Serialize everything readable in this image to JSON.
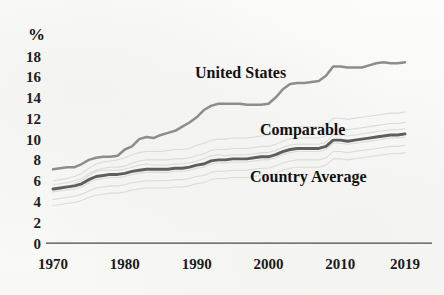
{
  "chart_data": {
    "type": "line",
    "title": "",
    "subtitle": "",
    "xlabel": "",
    "ylabel": "%",
    "ylim": [
      0,
      18
    ],
    "xlim": [
      1970,
      2019
    ],
    "grid": false,
    "legend_position": "inline-annotations",
    "y_ticks": [
      "18",
      "16",
      "14",
      "12",
      "10",
      "8",
      "6",
      "4",
      "2",
      "0"
    ],
    "y_tick_values": [
      18,
      16,
      14,
      12,
      10,
      8,
      6,
      4,
      2,
      0
    ],
    "x_ticks": [
      "1970",
      "1980",
      "1990",
      "2000",
      "2010",
      "2019"
    ],
    "x_tick_values": [
      1970,
      1980,
      1990,
      2000,
      2010,
      2019
    ],
    "annotations": [
      {
        "text": "United States",
        "x": 1990,
        "y": 16.2
      },
      {
        "text": "Comparable",
        "x": 2002,
        "y": 11.6
      },
      {
        "text": "Country Average",
        "x": 2002,
        "y": 8.0
      }
    ],
    "series": [
      {
        "name": "United States",
        "color": "#8d8d8c",
        "x": [
          1970,
          1971,
          1972,
          1973,
          1974,
          1975,
          1976,
          1977,
          1978,
          1979,
          1980,
          1981,
          1982,
          1983,
          1984,
          1985,
          1986,
          1987,
          1988,
          1989,
          1990,
          1991,
          1992,
          1993,
          1994,
          1995,
          1996,
          1997,
          1998,
          1999,
          2000,
          2001,
          2002,
          2003,
          2004,
          2005,
          2006,
          2007,
          2008,
          2009,
          2010,
          2011,
          2012,
          2013,
          2014,
          2015,
          2016,
          2017,
          2018,
          2019
        ],
        "values": [
          7.1,
          7.2,
          7.3,
          7.3,
          7.6,
          8.0,
          8.2,
          8.3,
          8.3,
          8.4,
          9.0,
          9.3,
          10.0,
          10.2,
          10.1,
          10.4,
          10.6,
          10.8,
          11.2,
          11.6,
          12.1,
          12.8,
          13.2,
          13.4,
          13.4,
          13.4,
          13.4,
          13.3,
          13.3,
          13.3,
          13.4,
          14.0,
          14.8,
          15.3,
          15.4,
          15.4,
          15.5,
          15.6,
          16.1,
          17.0,
          17.0,
          16.9,
          16.9,
          16.9,
          17.1,
          17.3,
          17.4,
          17.3,
          17.3,
          17.4
        ]
      },
      {
        "name": "Comparable Country Average",
        "color": "#5e5e5d",
        "x": [
          1970,
          1971,
          1972,
          1973,
          1974,
          1975,
          1976,
          1977,
          1978,
          1979,
          1980,
          1981,
          1982,
          1983,
          1984,
          1985,
          1986,
          1987,
          1988,
          1989,
          1990,
          1991,
          1992,
          1993,
          1994,
          1995,
          1996,
          1997,
          1998,
          1999,
          2000,
          2001,
          2002,
          2003,
          2004,
          2005,
          2006,
          2007,
          2008,
          2009,
          2010,
          2011,
          2012,
          2013,
          2014,
          2015,
          2016,
          2017,
          2018,
          2019
        ],
        "values": [
          5.2,
          5.3,
          5.4,
          5.5,
          5.7,
          6.1,
          6.4,
          6.5,
          6.6,
          6.6,
          6.7,
          6.9,
          7.0,
          7.1,
          7.1,
          7.1,
          7.1,
          7.2,
          7.2,
          7.3,
          7.5,
          7.6,
          7.9,
          8.0,
          8.0,
          8.1,
          8.1,
          8.1,
          8.2,
          8.3,
          8.3,
          8.5,
          8.8,
          9.0,
          9.1,
          9.1,
          9.1,
          9.1,
          9.3,
          9.9,
          9.9,
          9.8,
          9.9,
          10.0,
          10.1,
          10.2,
          10.3,
          10.4,
          10.4,
          10.5
        ]
      }
    ],
    "background_series_note": "faint individual comparable-country lines",
    "background_series": [
      {
        "name": "country-1",
        "values": [
          6.0,
          6.1,
          6.2,
          6.4,
          6.7,
          7.2,
          7.6,
          7.8,
          7.9,
          8.0,
          8.2,
          8.5,
          8.7,
          8.8,
          8.8,
          8.8,
          8.9,
          9.0,
          9.0,
          9.1,
          9.4,
          9.6,
          9.9,
          10.0,
          10.0,
          10.1,
          10.1,
          10.1,
          10.2,
          10.3,
          10.4,
          10.6,
          10.9,
          11.1,
          11.2,
          11.2,
          11.2,
          11.2,
          11.4,
          12.0,
          12.0,
          11.9,
          12.0,
          12.1,
          12.2,
          12.3,
          12.4,
          12.5,
          12.5,
          12.6
        ]
      },
      {
        "name": "country-2",
        "values": [
          5.6,
          5.7,
          5.8,
          6.0,
          6.2,
          6.7,
          7.0,
          7.2,
          7.3,
          7.3,
          7.4,
          7.7,
          7.9,
          8.0,
          8.0,
          8.0,
          8.0,
          8.1,
          8.1,
          8.2,
          8.4,
          8.6,
          8.9,
          9.0,
          9.0,
          9.1,
          9.1,
          9.1,
          9.2,
          9.3,
          9.3,
          9.5,
          9.8,
          10.0,
          10.1,
          10.1,
          10.1,
          10.1,
          10.3,
          11.0,
          11.0,
          10.9,
          11.0,
          11.1,
          11.2,
          11.3,
          11.4,
          11.5,
          11.5,
          11.6
        ]
      },
      {
        "name": "country-3",
        "values": [
          4.9,
          5.0,
          5.1,
          5.2,
          5.4,
          5.8,
          6.1,
          6.2,
          6.3,
          6.3,
          6.4,
          6.6,
          6.7,
          6.8,
          6.8,
          6.8,
          6.8,
          6.9,
          6.9,
          7.0,
          7.2,
          7.3,
          7.6,
          7.7,
          7.7,
          7.8,
          7.8,
          7.8,
          7.9,
          8.0,
          8.0,
          8.2,
          8.5,
          8.7,
          8.8,
          8.8,
          8.8,
          8.8,
          9.0,
          9.6,
          9.6,
          9.5,
          9.6,
          9.7,
          9.8,
          9.9,
          10.0,
          10.1,
          10.1,
          10.2
        ]
      },
      {
        "name": "country-4",
        "values": [
          4.2,
          4.3,
          4.4,
          4.5,
          4.7,
          5.0,
          5.3,
          5.4,
          5.5,
          5.5,
          5.6,
          5.8,
          5.9,
          6.0,
          6.0,
          6.0,
          6.0,
          6.1,
          6.1,
          6.2,
          6.4,
          6.5,
          6.8,
          6.9,
          6.9,
          7.0,
          7.0,
          7.0,
          7.1,
          7.2,
          7.2,
          7.4,
          7.7,
          7.9,
          8.0,
          8.0,
          8.0,
          8.0,
          8.2,
          8.8,
          8.8,
          8.7,
          8.8,
          8.9,
          9.0,
          9.1,
          9.2,
          9.3,
          9.3,
          9.4
        ]
      },
      {
        "name": "country-5",
        "values": [
          5.0,
          5.2,
          5.4,
          5.7,
          6.0,
          6.5,
          6.9,
          7.0,
          7.0,
          7.0,
          7.1,
          7.3,
          7.5,
          7.6,
          7.5,
          7.5,
          7.5,
          7.6,
          7.6,
          7.7,
          7.9,
          8.1,
          8.4,
          8.5,
          8.4,
          8.5,
          8.5,
          8.5,
          8.6,
          8.7,
          8.7,
          8.9,
          9.2,
          9.4,
          9.5,
          9.5,
          9.5,
          9.5,
          9.7,
          10.4,
          10.4,
          10.3,
          10.4,
          10.5,
          10.6,
          10.7,
          10.8,
          10.9,
          10.9,
          11.0
        ]
      },
      {
        "name": "country-6",
        "values": [
          3.6,
          3.7,
          3.8,
          3.9,
          4.1,
          4.4,
          4.6,
          4.7,
          4.8,
          4.8,
          4.9,
          5.1,
          5.2,
          5.3,
          5.3,
          5.3,
          5.3,
          5.4,
          5.4,
          5.5,
          5.7,
          5.8,
          6.1,
          6.2,
          6.2,
          6.3,
          6.3,
          6.3,
          6.4,
          6.5,
          6.5,
          6.7,
          7.0,
          7.2,
          7.3,
          7.3,
          7.3,
          7.3,
          7.5,
          8.1,
          8.1,
          8.0,
          8.1,
          8.2,
          8.3,
          8.4,
          8.5,
          8.6,
          8.6,
          8.7
        ]
      }
    ]
  }
}
